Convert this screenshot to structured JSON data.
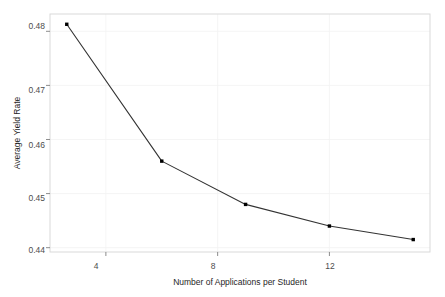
{
  "chart_data": {
    "type": "line",
    "title": "",
    "subtitle": "",
    "xlabel": "Number of Applications per Student",
    "ylabel": "Average Yield Rate",
    "x": [
      2.6,
      6.0,
      9.0,
      12.0,
      15.0
    ],
    "values": [
      0.4813,
      0.456,
      0.448,
      0.444,
      0.4415
    ],
    "series": [
      {
        "name": "Average Yield Rate",
        "x": [
          2.6,
          6.0,
          9.0,
          12.0,
          15.0
        ],
        "values": [
          0.4813,
          0.456,
          0.448,
          0.444,
          0.4415
        ]
      }
    ],
    "xticks": [
      4,
      8,
      12
    ],
    "xtick_labels": [
      "4",
      "8",
      "12"
    ],
    "yticks": [
      0.44,
      0.45,
      0.46,
      0.47,
      0.48
    ],
    "ytick_labels": [
      "0.44",
      "0.45",
      "0.46",
      "0.47",
      "0.48"
    ],
    "xlim": [
      2.0,
      15.6
    ],
    "ylim": [
      0.4392,
      0.4832
    ],
    "grid": true,
    "legend": "none",
    "line_color": "#333333",
    "marker_color": "#000000",
    "marker": "square",
    "panel_background": "#ffffff",
    "panel_border_color": "#d9d9d9",
    "grid_color": "#f2f2f2"
  },
  "axis": {
    "x_title": "Number of Applications per Student",
    "y_title": "Average Yield Rate",
    "x_tick_0": "4",
    "x_tick_1": "8",
    "x_tick_2": "12",
    "y_tick_0": "0.44",
    "y_tick_1": "0.45",
    "y_tick_2": "0.46",
    "y_tick_3": "0.47",
    "y_tick_4": "0.48"
  }
}
